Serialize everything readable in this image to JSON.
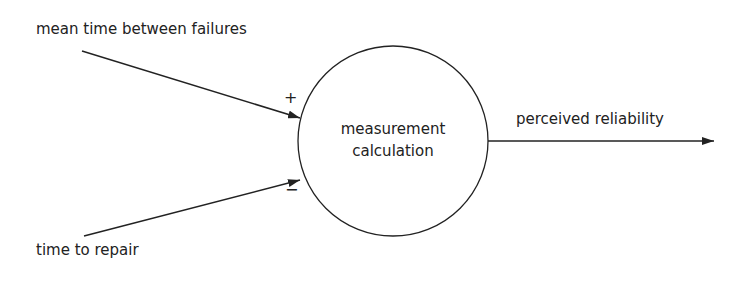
{
  "diagram": {
    "inputs": [
      {
        "label": "mean time between failures",
        "sign": "+"
      },
      {
        "label": "time to repair",
        "sign": "−"
      }
    ],
    "process": {
      "line1": "measurement",
      "line2": "calculation"
    },
    "output": {
      "label": "perceived reliability"
    }
  },
  "colors": {
    "stroke": "#222222",
    "background": "#ffffff"
  }
}
